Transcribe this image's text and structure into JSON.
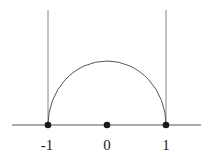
{
  "diagram": {
    "axis": {
      "x_start": 12,
      "x_end": 201,
      "y": 125,
      "color": "#555555"
    },
    "points": [
      {
        "value": -1,
        "label": "-1",
        "x": 48
      },
      {
        "value": 0,
        "label": "0",
        "x": 107
      },
      {
        "value": 1,
        "label": "1",
        "x": 166
      }
    ],
    "vertical_lines": [
      {
        "x": 48,
        "y_top": 10,
        "y_bottom": 125
      },
      {
        "x": 166,
        "y_top": 10,
        "y_bottom": 125
      }
    ],
    "arc": {
      "cx": 107,
      "cy": 125,
      "rx": 59,
      "ry": 64,
      "color": "#555555"
    },
    "point_color": "#1a1a1a",
    "labels": {
      "left": "-1",
      "center": "0",
      "right": "1"
    }
  }
}
